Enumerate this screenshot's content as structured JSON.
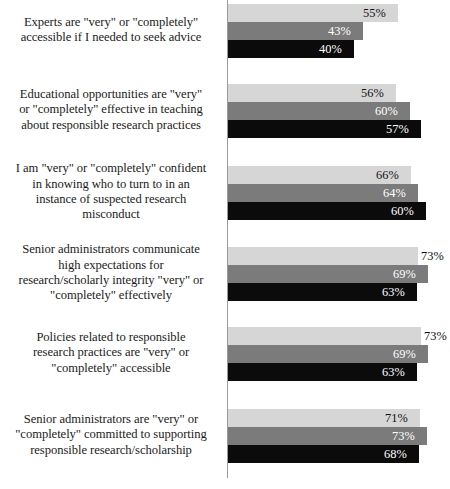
{
  "chart_data": {
    "type": "bar",
    "orientation": "horizontal",
    "title": "",
    "subtitle": "",
    "xlabel": "",
    "ylabel": "",
    "xlim": [
      0,
      100
    ],
    "grid": false,
    "legend_position": "none",
    "value_suffix": "%",
    "series": [
      {
        "name": "Series 1",
        "color": "#d6d6d6",
        "label_color": "#111111",
        "values": [
          55,
          56,
          66,
          73,
          73,
          71
        ]
      },
      {
        "name": "Series 2",
        "color": "#7b7b7b",
        "label_color": "#ffffff",
        "values": [
          43,
          60,
          64,
          69,
          69,
          73
        ]
      },
      {
        "name": "Series 3",
        "color": "#0b0b0b",
        "label_color": "#ffffff",
        "values": [
          40,
          57,
          60,
          63,
          63,
          68
        ]
      }
    ],
    "categories": [
      "Experts are \"very\" or \"completely\" accessible if I needed to seek advice",
      "Educational opportunities are \"very\" or \"completely\" effective in teaching about responsible research practices",
      "I am \"very\" or \"completely\" confident in knowing who to turn to in an instance of suspected research misconduct",
      "Senior administrators communicate high expectations for research/scholarly integrity \"very\" or \"completely\" effectively",
      "Policies related to responsible research practices are \"very\" or \"completely\" accessible",
      "Senior administrators are \"very\" or \"completely\" committed to supporting responsible research/scholarship"
    ],
    "groups": [
      {
        "label_lines": [
          "Experts are \"very\" or \"completely\"",
          "accessible if I needed to seek advice"
        ],
        "bars": [
          {
            "value_label": "55%",
            "value": 55,
            "series": 1,
            "px_width": 170,
            "label_inside": true
          },
          {
            "value_label": "43%",
            "value": 43,
            "series": 2,
            "px_width": 135,
            "label_inside": true
          },
          {
            "value_label": "40%",
            "value": 40,
            "series": 3,
            "px_width": 126,
            "label_inside": true
          }
        ]
      },
      {
        "label_lines": [
          "Educational opportunities are \"very\"",
          "or \"completely\" effective in teaching",
          "about responsible research practices"
        ],
        "bars": [
          {
            "value_label": "56%",
            "value": 56,
            "series": 1,
            "px_width": 168,
            "label_inside": true
          },
          {
            "value_label": "60%",
            "value": 60,
            "series": 2,
            "px_width": 182,
            "label_inside": true
          },
          {
            "value_label": "57%",
            "value": 57,
            "series": 3,
            "px_width": 193,
            "label_inside": true
          }
        ]
      },
      {
        "label_lines": [
          "I am \"very\" or \"completely\" confident",
          "in knowing who to turn to in an",
          "instance of suspected research",
          "misconduct"
        ],
        "bars": [
          {
            "value_label": "66%",
            "value": 66,
            "series": 1,
            "px_width": 183,
            "label_inside": true
          },
          {
            "value_label": "64%",
            "value": 64,
            "series": 2,
            "px_width": 190,
            "label_inside": true
          },
          {
            "value_label": "60%",
            "value": 60,
            "series": 3,
            "px_width": 198,
            "label_inside": true
          }
        ]
      },
      {
        "label_lines": [
          "Senior administrators communicate",
          "high expectations for",
          "research/scholarly integrity \"very\" or",
          "\"completely\" effectively"
        ],
        "bars": [
          {
            "value_label": "73%",
            "value": 73,
            "series": 1,
            "px_width": 190,
            "label_inside": false
          },
          {
            "value_label": "69%",
            "value": 69,
            "series": 2,
            "px_width": 200,
            "label_inside": true
          },
          {
            "value_label": "63%",
            "value": 63,
            "series": 3,
            "px_width": 189,
            "label_inside": true
          }
        ]
      },
      {
        "label_lines": [
          "Policies related to responsible",
          "research practices are \"very\" or",
          "\"completely\" accessible"
        ],
        "bars": [
          {
            "value_label": "73%",
            "value": 73,
            "series": 1,
            "px_width": 193,
            "label_inside": false
          },
          {
            "value_label": "69%",
            "value": 69,
            "series": 2,
            "px_width": 200,
            "label_inside": true
          },
          {
            "value_label": "63%",
            "value": 63,
            "series": 3,
            "px_width": 189,
            "label_inside": true
          }
        ]
      },
      {
        "label_lines": [
          "Senior administrators are \"very\" or",
          "\"completely\" committed to supporting",
          "responsible research/scholarship"
        ],
        "bars": [
          {
            "value_label": "71%",
            "value": 71,
            "series": 1,
            "px_width": 192,
            "label_inside": true
          },
          {
            "value_label": "73%",
            "value": 73,
            "series": 2,
            "px_width": 199,
            "label_inside": true
          },
          {
            "value_label": "68%",
            "value": 68,
            "series": 3,
            "px_width": 191,
            "label_inside": true
          }
        ]
      }
    ]
  }
}
